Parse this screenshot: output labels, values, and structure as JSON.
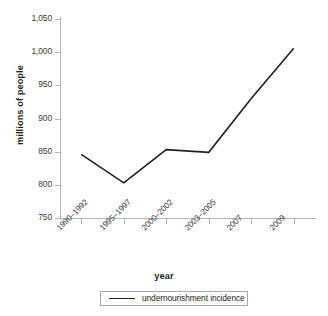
{
  "chart_data": {
    "type": "line",
    "title": "",
    "xlabel": "year",
    "ylabel": "millions of people",
    "categories": [
      "1990–1992",
      "1995–1997",
      "2000–2002",
      "2003–2005",
      "2007",
      "2009"
    ],
    "series": [
      {
        "name": "undernourishment incidence",
        "values": [
          846,
          803,
          853,
          849,
          930,
          1006
        ],
        "color": "#231f20"
      }
    ],
    "ylim": [
      750,
      1050
    ],
    "y_ticks": [
      750,
      800,
      850,
      900,
      950,
      1000,
      1050
    ],
    "y_tick_labels": [
      "750",
      "800",
      "850",
      "900",
      "950",
      "1,000",
      "1,050"
    ],
    "grid": false,
    "legend_position": "bottom",
    "axis_color": "#b3b3b3",
    "background": "#ffffff"
  },
  "axes": {
    "y_title": "millions of people",
    "x_title": "year"
  },
  "legend": {
    "entries": [
      {
        "label": "undernourishment incidence",
        "color": "#231f20"
      }
    ]
  }
}
